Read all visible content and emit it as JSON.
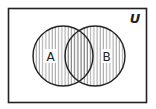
{
  "diagram": {
    "type": "venn",
    "universe_label": "U",
    "sets": [
      {
        "label": "A",
        "cx": 63,
        "cy": 56,
        "r": 30
      },
      {
        "label": "B",
        "cx": 95,
        "cy": 56,
        "r": 30
      }
    ],
    "shaded_region": "A ∪ B",
    "shading_style": "vertical-hatch",
    "colors": {
      "stroke": "#222222",
      "hatch": "#555555",
      "background": "#ffffff"
    }
  }
}
